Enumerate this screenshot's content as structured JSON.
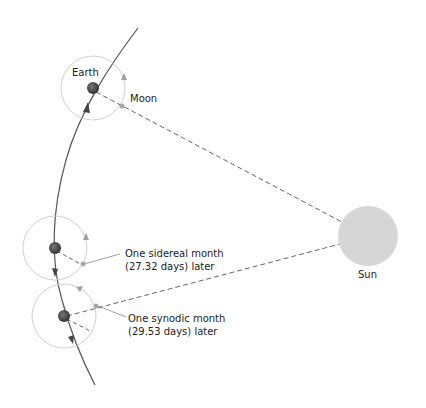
{
  "diagram": {
    "labels": {
      "earth": "Earth",
      "moon": "Moon",
      "sun": "Sun",
      "sidereal_line1": "One sidereal month",
      "sidereal_line2": "(27.32 days) later",
      "synodic_line1": "One synodic month",
      "synodic_line2": "(29.53 days) later"
    },
    "colors": {
      "orbit": "#555555",
      "moon_orbit": "#c8c8c8",
      "earth": "#4a4a4a",
      "sun": "#d6d6d6",
      "dashed": "#666666",
      "arrow": "#9a9a9a"
    },
    "positions": [
      {
        "name": "start",
        "earth": [
          93,
          88
        ],
        "moon": [
          122,
          107
        ]
      },
      {
        "name": "sidereal",
        "earth": [
          53,
          248
        ],
        "moon": [
          82,
          266
        ]
      },
      {
        "name": "synodic",
        "earth": [
          64,
          316
        ],
        "moon": [
          96,
          306
        ]
      }
    ],
    "sun": {
      "center": [
        368,
        236
      ],
      "radius": 30
    }
  }
}
